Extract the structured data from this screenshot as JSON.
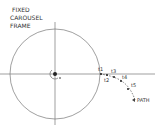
{
  "title": {
    "line1": "FIXED",
    "line2": "CAROUSEL",
    "line3": "FRAME"
  },
  "time_labels": [
    "t1",
    "t2",
    "t3",
    "t4",
    "t5"
  ],
  "path_label": "PATH",
  "colors": {
    "stroke": "#555555",
    "text": "#333333",
    "background": "#ffffff"
  }
}
